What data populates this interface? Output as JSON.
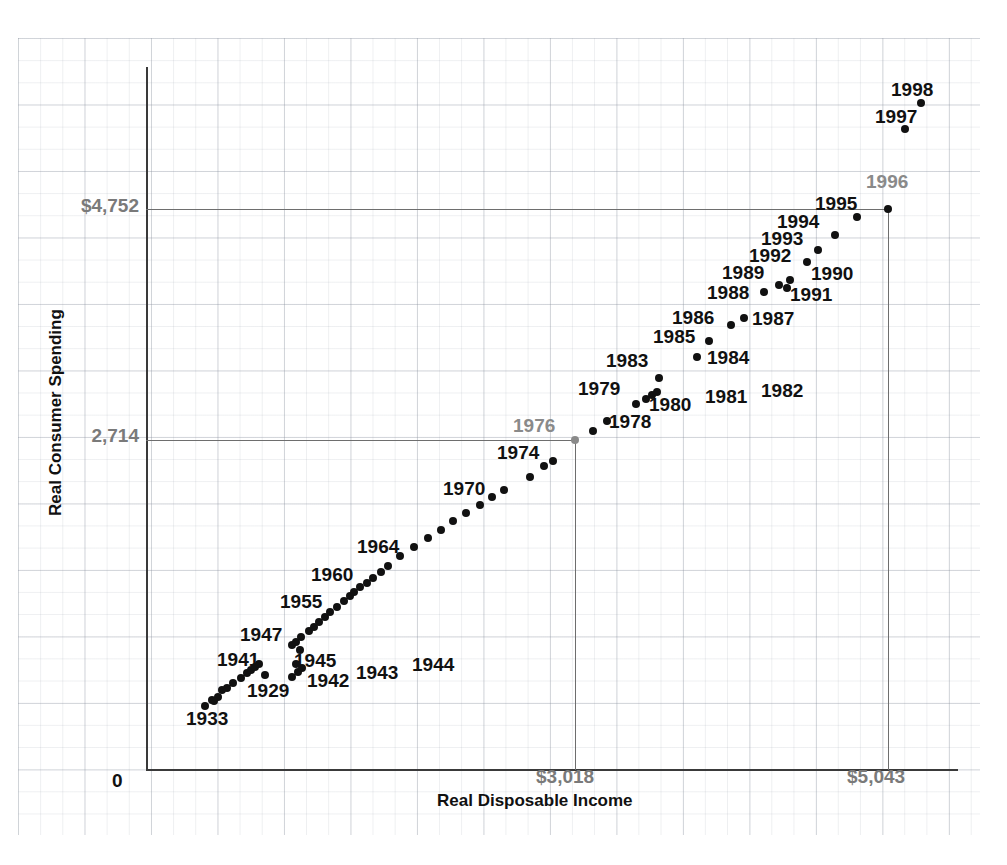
{
  "chart_data": {
    "type": "scatter",
    "title": "",
    "xlabel": "Real Disposable Income",
    "ylabel": "Real Consumer Spending",
    "xlim": [
      0,
      6000
    ],
    "ylim": [
      0,
      6000
    ],
    "grid": true,
    "legend": null,
    "axis": {
      "y_ticks": [
        "$4,752",
        "2,714",
        "0"
      ],
      "x_ticks": [
        "$3,018",
        "$5,043"
      ],
      "y_origin_label": "0"
    },
    "reference_lines": {
      "horizontal": [
        "$4,752",
        "2,714"
      ],
      "vertical": [
        "$3,018",
        "$5,043"
      ]
    },
    "highlighted_points": [
      "1976",
      "1996"
    ],
    "points": [
      {
        "label": "1929",
        "x": 222,
        "y": 690,
        "labeled": true,
        "lx": 247,
        "ly": 690,
        "anchor": "left"
      },
      {
        "label": "1930",
        "x": 212,
        "y": 700,
        "labeled": false
      },
      {
        "label": "1931",
        "x": 205,
        "y": 706,
        "labeled": false
      },
      {
        "label": "1932",
        "x": 218,
        "y": 697,
        "labeled": false
      },
      {
        "label": "1933",
        "x": 214,
        "y": 701,
        "labeled": true,
        "lx": 186,
        "ly": 718,
        "anchor": "left"
      },
      {
        "label": "1934",
        "x": 227,
        "y": 688,
        "labeled": false
      },
      {
        "label": "1935",
        "x": 233,
        "y": 683,
        "labeled": false
      },
      {
        "label": "1936",
        "x": 241,
        "y": 678,
        "labeled": false
      },
      {
        "label": "1937",
        "x": 247,
        "y": 673,
        "labeled": false
      },
      {
        "label": "1938",
        "x": 251,
        "y": 670,
        "labeled": false
      },
      {
        "label": "1939",
        "x": 255,
        "y": 667,
        "labeled": false
      },
      {
        "label": "1940",
        "x": 259,
        "y": 664,
        "labeled": false
      },
      {
        "label": "1941",
        "x": 265,
        "y": 675,
        "labeled": true,
        "lx": 217,
        "ly": 659,
        "anchor": "left"
      },
      {
        "label": "1942",
        "x": 292,
        "y": 677,
        "labeled": true,
        "lx": 307,
        "ly": 680,
        "anchor": "left"
      },
      {
        "label": "1943",
        "x": 298,
        "y": 672,
        "labeled": true,
        "lx": 356,
        "ly": 672,
        "anchor": "left"
      },
      {
        "label": "1944",
        "x": 302,
        "y": 668,
        "labeled": true,
        "lx": 412,
        "ly": 664,
        "anchor": "left"
      },
      {
        "label": "1945",
        "x": 296,
        "y": 664,
        "labeled": true,
        "lx": 294,
        "ly": 660,
        "anchor": "left"
      },
      {
        "label": "1946",
        "x": 300,
        "y": 650,
        "labeled": false
      },
      {
        "label": "1947",
        "x": 292,
        "y": 645,
        "labeled": true,
        "lx": 240,
        "ly": 634,
        "anchor": "left"
      },
      {
        "label": "1948",
        "x": 296,
        "y": 642,
        "labeled": false
      },
      {
        "label": "1949",
        "x": 301,
        "y": 637,
        "labeled": false
      },
      {
        "label": "1950",
        "x": 309,
        "y": 631,
        "labeled": false
      },
      {
        "label": "1951",
        "x": 314,
        "y": 627,
        "labeled": false
      },
      {
        "label": "1952",
        "x": 319,
        "y": 622,
        "labeled": false
      },
      {
        "label": "1953",
        "x": 325,
        "y": 617,
        "labeled": false
      },
      {
        "label": "1954",
        "x": 330,
        "y": 612,
        "labeled": false
      },
      {
        "label": "1955",
        "x": 337,
        "y": 607,
        "labeled": true,
        "lx": 280,
        "ly": 601,
        "anchor": "left"
      },
      {
        "label": "1956",
        "x": 344,
        "y": 601,
        "labeled": false
      },
      {
        "label": "1957",
        "x": 350,
        "y": 596,
        "labeled": false
      },
      {
        "label": "1958",
        "x": 354,
        "y": 592,
        "labeled": false
      },
      {
        "label": "1959",
        "x": 360,
        "y": 587,
        "labeled": false
      },
      {
        "label": "1960",
        "x": 367,
        "y": 583,
        "labeled": true,
        "lx": 311,
        "ly": 574,
        "anchor": "left"
      },
      {
        "label": "1961",
        "x": 373,
        "y": 578,
        "labeled": false
      },
      {
        "label": "1962",
        "x": 381,
        "y": 572,
        "labeled": false
      },
      {
        "label": "1963",
        "x": 388,
        "y": 566,
        "labeled": false
      },
      {
        "label": "1964",
        "x": 400,
        "y": 556,
        "labeled": true,
        "lx": 357,
        "ly": 546,
        "anchor": "left"
      },
      {
        "label": "1965",
        "x": 414,
        "y": 547,
        "labeled": false
      },
      {
        "label": "1966",
        "x": 428,
        "y": 538,
        "labeled": false
      },
      {
        "label": "1967",
        "x": 441,
        "y": 530,
        "labeled": false
      },
      {
        "label": "1968",
        "x": 453,
        "y": 521,
        "labeled": false
      },
      {
        "label": "1969",
        "x": 466,
        "y": 513,
        "labeled": false
      },
      {
        "label": "1970",
        "x": 480,
        "y": 505,
        "labeled": true,
        "lx": 443,
        "ly": 488,
        "anchor": "left"
      },
      {
        "label": "1971",
        "x": 492,
        "y": 497,
        "labeled": false
      },
      {
        "label": "1972",
        "x": 504,
        "y": 490,
        "labeled": false
      },
      {
        "label": "1973",
        "x": 530,
        "y": 477,
        "labeled": false
      },
      {
        "label": "1974",
        "x": 544,
        "y": 466,
        "labeled": true,
        "lx": 497,
        "ly": 452,
        "anchor": "left"
      },
      {
        "label": "1975",
        "x": 553,
        "y": 461,
        "labeled": false
      },
      {
        "label": "1976",
        "x": 575,
        "y": 440,
        "labeled": true,
        "lx": 513,
        "ly": 425,
        "anchor": "left",
        "gray": true
      },
      {
        "label": "1977",
        "x": 593,
        "y": 431,
        "labeled": false
      },
      {
        "label": "1978",
        "x": 607,
        "y": 421,
        "labeled": true,
        "lx": 609,
        "ly": 421,
        "anchor": "left"
      },
      {
        "label": "1979",
        "x": 636,
        "y": 404,
        "labeled": true,
        "lx": 578,
        "ly": 388,
        "anchor": "left"
      },
      {
        "label": "1980",
        "x": 646,
        "y": 399,
        "labeled": true,
        "lx": 649,
        "ly": 404,
        "anchor": "left"
      },
      {
        "label": "1981",
        "x": 652,
        "y": 395,
        "labeled": true,
        "lx": 705,
        "ly": 396,
        "anchor": "left"
      },
      {
        "label": "1982",
        "x": 657,
        "y": 392,
        "labeled": true,
        "lx": 761,
        "ly": 390,
        "anchor": "left"
      },
      {
        "label": "1983",
        "x": 659,
        "y": 378,
        "labeled": true,
        "lx": 606,
        "ly": 360,
        "anchor": "left"
      },
      {
        "label": "1984",
        "x": 697,
        "y": 357,
        "labeled": true,
        "lx": 707,
        "ly": 357,
        "anchor": "left"
      },
      {
        "label": "1985",
        "x": 709,
        "y": 341,
        "labeled": true,
        "lx": 653,
        "ly": 336,
        "anchor": "left"
      },
      {
        "label": "1986",
        "x": 731,
        "y": 325,
        "labeled": true,
        "lx": 672,
        "ly": 317,
        "anchor": "left"
      },
      {
        "label": "1987",
        "x": 744,
        "y": 318,
        "labeled": true,
        "lx": 752,
        "ly": 318,
        "anchor": "left"
      },
      {
        "label": "1988",
        "x": 764,
        "y": 292,
        "labeled": true,
        "lx": 707,
        "ly": 292,
        "anchor": "left"
      },
      {
        "label": "1989",
        "x": 779,
        "y": 285,
        "labeled": true,
        "lx": 722,
        "ly": 272,
        "anchor": "left"
      },
      {
        "label": "1990",
        "x": 790,
        "y": 280,
        "labeled": true,
        "lx": 811,
        "ly": 273,
        "anchor": "left"
      },
      {
        "label": "1991",
        "x": 787,
        "y": 288,
        "labeled": true,
        "lx": 790,
        "ly": 294,
        "anchor": "left"
      },
      {
        "label": "1992",
        "x": 807,
        "y": 262,
        "labeled": true,
        "lx": 749,
        "ly": 255,
        "anchor": "left"
      },
      {
        "label": "1993",
        "x": 818,
        "y": 250,
        "labeled": true,
        "lx": 761,
        "ly": 238,
        "anchor": "left"
      },
      {
        "label": "1994",
        "x": 835,
        "y": 235,
        "labeled": true,
        "lx": 777,
        "ly": 221,
        "anchor": "left"
      },
      {
        "label": "1995",
        "x": 857,
        "y": 217,
        "labeled": true,
        "lx": 815,
        "ly": 203,
        "anchor": "left"
      },
      {
        "label": "1996",
        "x": 888,
        "y": 209,
        "labeled": true,
        "lx": 866,
        "ly": 181,
        "anchor": "left",
        "gray_label": true
      },
      {
        "label": "1997",
        "x": 905,
        "y": 129,
        "labeled": true,
        "lx": 875,
        "ly": 116,
        "anchor": "left"
      },
      {
        "label": "1998",
        "x": 921,
        "y": 103,
        "labeled": true,
        "lx": 891,
        "ly": 89,
        "anchor": "left"
      }
    ]
  }
}
